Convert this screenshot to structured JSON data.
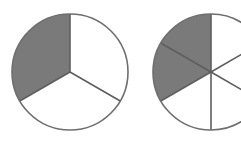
{
  "figure": {
    "background_color": "#ffffff",
    "shade_color": "#7a7a7a",
    "unshaded_color": "#ffffff",
    "outline_color": "#6e6e6e",
    "divider_color": "#5e5e5e",
    "outline_width": 1.6,
    "divider_width": 1.6
  },
  "circles": [
    {
      "name": "circle-left",
      "center_x": 70,
      "center_y": 72,
      "radius": 58,
      "total_parts": 3,
      "shaded_parts": 1,
      "fraction_text": "1/3",
      "start_angle_deg": -90,
      "shaded_index_start": 2,
      "slice_angle_deg": 120
    },
    {
      "name": "circle-right",
      "center_x": 211,
      "center_y": 72,
      "radius": 58,
      "total_parts": 6,
      "shaded_parts": 2,
      "fraction_text": "2/6",
      "start_angle_deg": -90,
      "shaded_index_start": 4,
      "slice_angle_deg": 60
    }
  ],
  "labels": [
    {
      "name": "label-left-fraction",
      "text": "1",
      "x": 105,
      "tone": "dark"
    },
    {
      "name": "label-right-fraction",
      "text": "2",
      "x": 166,
      "tone": "light"
    }
  ],
  "chart_data": {
    "type": "pie",
    "xlabel": "",
    "ylabel": "",
    "charts": [
      {
        "name": "one-third",
        "categories": [
          "shaded",
          "unshaded"
        ],
        "values": [
          1,
          2
        ],
        "total_parts": 3,
        "shaded_parts": 1,
        "fraction": "1/3",
        "value_decimal": 0.3333
      },
      {
        "name": "two-sixths",
        "categories": [
          "shaded",
          "unshaded"
        ],
        "values": [
          2,
          4
        ],
        "total_parts": 6,
        "shaded_parts": 2,
        "fraction": "2/6",
        "value_decimal": 0.3333
      }
    ],
    "legend": [],
    "annotations": [
      "1",
      "2"
    ]
  }
}
